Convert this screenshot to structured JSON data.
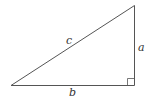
{
  "diagram": {
    "type": "right-triangle",
    "labels": {
      "hypotenuse": "c",
      "vertical_leg": "a",
      "horizontal_leg": "b"
    },
    "colors": {
      "stroke": "#555555",
      "text": "#333333"
    }
  }
}
